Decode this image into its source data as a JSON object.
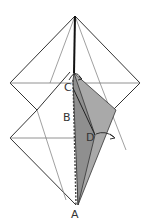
{
  "diagram": {
    "type": "origami fold diagram",
    "labels": {
      "a": "A",
      "b": "B",
      "c": "C",
      "d": "D"
    },
    "colors": {
      "line": "#222222",
      "thin_line": "#555555",
      "shaded_flap": "#a9a9a9",
      "shaded_dark": "#8a8a8a",
      "background": "#ffffff"
    }
  }
}
